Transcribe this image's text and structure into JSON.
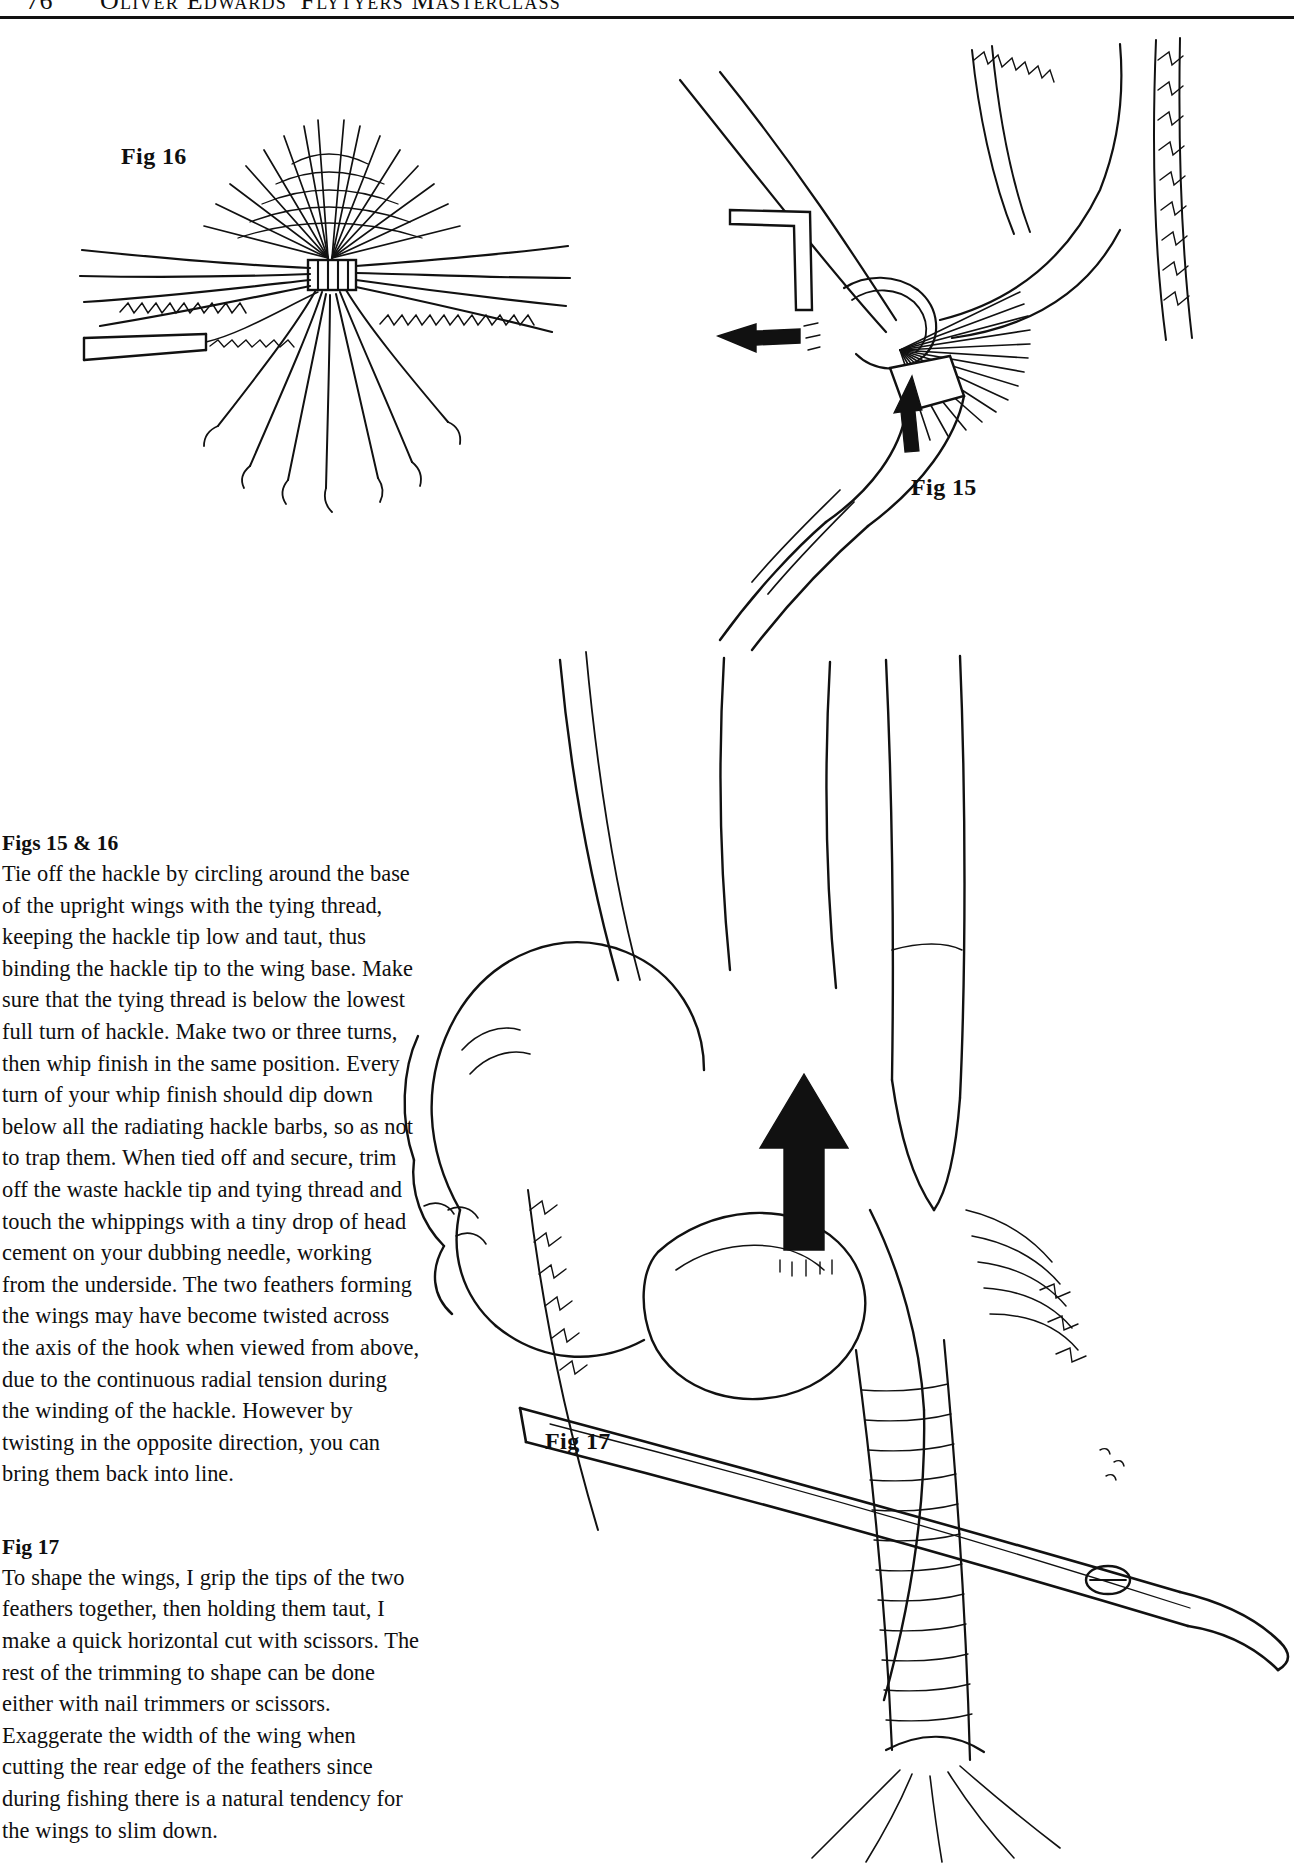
{
  "page": {
    "folio": "76",
    "running_head": "Oliver Edwards' Flytyers Masterclass",
    "background": "#ffffff",
    "ink": "#0f0f0f"
  },
  "figures": [
    {
      "id": "fig16",
      "label": "Fig 16",
      "caption_ref": "Figs 15 & 16",
      "description": "line drawing of hackle tip bound at wing base, viewed from above"
    },
    {
      "id": "fig15",
      "label": "Fig 15",
      "caption_ref": "Figs 15 & 16",
      "description": "line drawing of tying thread circling the upright wing base with hackle pliers"
    },
    {
      "id": "fig17",
      "label": "Fig 17",
      "caption_ref": "Fig 17",
      "description": "line drawing of fingers gripping feather tips while scissors make a horizontal cut"
    }
  ],
  "sections": [
    {
      "heading": "Figs 15 & 16",
      "paragraphs": [
        "Tie off the hackle by circling around the base of the upright wings with the tying thread, keeping the hackle tip low and taut, thus binding the hackle tip to the wing base. Make sure that the tying thread is below the lowest full turn of hackle. Make two or three turns, then whip finish in the same position. Every turn of your whip finish should dip down below all the radiating hackle barbs, so as not to trap them. When tied off and secure, trim off the waste hackle tip and tying thread and touch the whippings with a tiny drop of head cement on your dubbing needle, working from the underside. The two feathers forming the wings may have become twisted across the axis of the hook when viewed from above, due to the continuous radial tension during the winding of the hackle. However by twisting in the opposite direction, you can bring them back into line."
      ]
    },
    {
      "heading": "Fig 17",
      "paragraphs": [
        "To shape the wings, I grip the tips of the two feathers together, then holding them taut, I make a quick horizontal cut with scissors. The rest of the trimming to shape can be done either with nail trimmers or scissors. Exaggerate the width of the wing when cutting the rear edge of the feathers since during fishing there is a natural tendency for the wings to slim down."
      ]
    }
  ]
}
